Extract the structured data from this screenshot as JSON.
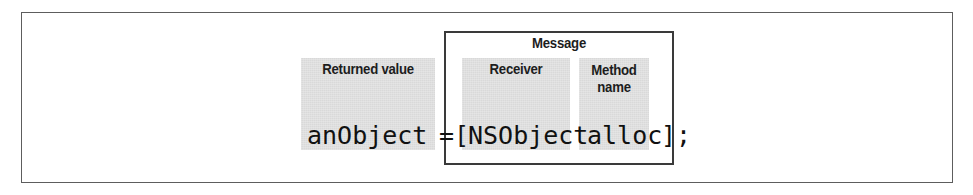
{
  "figure": {
    "kind": "annotated-code-diagram",
    "frame_border_color": "#5d5d5d",
    "highlight_color": "#d9d9d9",
    "box_border_color": "#3a3a3a",
    "text_color": "#1d1d1d"
  },
  "group": {
    "message_label": "Message"
  },
  "annotations": {
    "returned_value": "Returned value",
    "receiver": "Receiver",
    "method_name": "Method\nname"
  },
  "code": {
    "full_statement": "anObject = [NSObject alloc];",
    "returned_value_token": "anObject",
    "assignment_operator": "=",
    "open_bracket": "[",
    "receiver_token": "NSObject",
    "method_name_token": "alloc",
    "close_bracket_semicolon": "];"
  }
}
